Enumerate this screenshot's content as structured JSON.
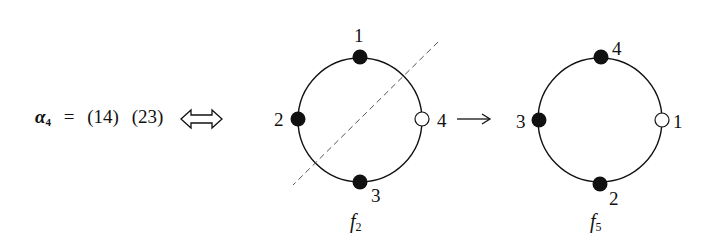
{
  "equation": {
    "lhs_symbol": "α",
    "lhs_subscript": "4",
    "equals": "=",
    "cycles": [
      "(14)",
      "(23)"
    ],
    "equivalence_symbol": "double-arrow-icon"
  },
  "diagrams": [
    {
      "name": "f2",
      "caption_main": "f",
      "caption_sub": "2",
      "nodes": [
        {
          "label": "1",
          "position": "top",
          "filled": true
        },
        {
          "label": "2",
          "position": "left",
          "filled": true
        },
        {
          "label": "3",
          "position": "bottom",
          "filled": true
        },
        {
          "label": "4",
          "position": "right",
          "filled": false
        }
      ],
      "has_reflection_axis": true
    },
    {
      "name": "f5",
      "caption_main": "f",
      "caption_sub": "5",
      "nodes": [
        {
          "label": "4",
          "position": "top",
          "filled": true
        },
        {
          "label": "3",
          "position": "left",
          "filled": true
        },
        {
          "label": "2",
          "position": "bottom",
          "filled": true
        },
        {
          "label": "1",
          "position": "right",
          "filled": false
        }
      ],
      "has_reflection_axis": false
    }
  ],
  "transition_arrow": "right-arrow-icon",
  "colors": {
    "stroke": "#111111",
    "dashed_axis": "#555555",
    "background": "#ffffff"
  }
}
